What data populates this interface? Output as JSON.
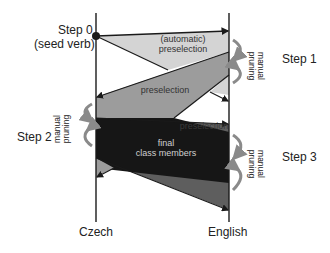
{
  "diagram": {
    "axes": {
      "left_label": "Czech",
      "right_label": "English"
    },
    "steps": {
      "step0_title": "Step 0",
      "step0_sub": "(seed verb)",
      "step1": "Step 1",
      "step2": "Step 2",
      "step3": "Step 3"
    },
    "regions": {
      "auto_preselection_line1": "(automatic)",
      "auto_preselection_line2": "preselection",
      "preselection_cz": "preselection",
      "preselection_en": "preselection",
      "final_line1": "final",
      "final_line2": "class members"
    },
    "pruning": {
      "right1_line1": "manual",
      "right1_line2": "pruning",
      "left2_line1": "manual",
      "left2_line2": "pruning",
      "right3_line1": "manual",
      "right3_line2": "pruning"
    },
    "colors": {
      "light_gray": "#d4d4d4",
      "mid_gray": "#9c9c9c",
      "dark_gray": "#5e5e5e",
      "near_black": "#161616",
      "arrow_gray": "#8a8a8a",
      "line": "#1a1a1a"
    }
  }
}
